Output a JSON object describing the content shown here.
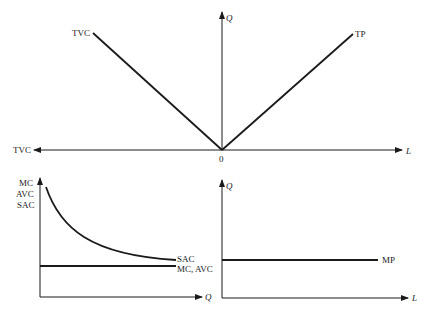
{
  "diagram": {
    "top_panel": {
      "x_axis_right_label": "L",
      "x_axis_left_label": "TVC",
      "y_axis_label": "Q",
      "origin_label": "0",
      "curves": [
        {
          "name": "TVC",
          "label": "TVC",
          "shape": "straight line from origin up-left"
        },
        {
          "name": "TP",
          "label": "TP",
          "shape": "straight line from origin up-right"
        }
      ]
    },
    "bottom_left_panel": {
      "y_axis_label_line1": "MC",
      "y_axis_label_line2": "AVC",
      "y_axis_label_line3": "SAC",
      "x_axis_label": "Q",
      "curves": [
        {
          "name": "SAC",
          "label": "SAC",
          "shape": "downward sloping convex curve"
        },
        {
          "name": "MC-AVC",
          "label": "MC, AVC",
          "shape": "horizontal line"
        }
      ]
    },
    "bottom_right_panel": {
      "y_axis_label": "Q",
      "x_axis_label": "L",
      "curves": [
        {
          "name": "MP",
          "label": "MP",
          "shape": "horizontal line"
        }
      ]
    },
    "colors": {
      "ink": "#1a1a1a",
      "background": "#ffffff"
    }
  }
}
